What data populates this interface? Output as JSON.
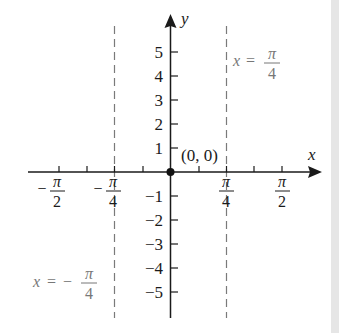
{
  "diagram": {
    "title": "",
    "axes": {
      "x_label": "x",
      "y_label": "y",
      "origin_label": "(0, 0)"
    },
    "y_ticks": [
      {
        "label": "5",
        "value": 5
      },
      {
        "label": "4",
        "value": 4
      },
      {
        "label": "3",
        "value": 3
      },
      {
        "label": "2",
        "value": 2
      },
      {
        "label": "1",
        "value": 1
      },
      {
        "label": "−1",
        "value": -1
      },
      {
        "label": "−2",
        "value": -2
      },
      {
        "label": "−3",
        "value": -3
      },
      {
        "label": "−4",
        "value": -4
      },
      {
        "label": "−5",
        "value": -5
      }
    ],
    "x_ticks": [
      {
        "sign": "−",
        "num": "π",
        "den": "2",
        "value": "-pi/2"
      },
      {
        "sign": "−",
        "num": "π",
        "den": "4",
        "value": "-pi/4"
      },
      {
        "sign": "",
        "num": "π",
        "den": "4",
        "value": "pi/4"
      },
      {
        "sign": "",
        "num": "π",
        "den": "2",
        "value": "pi/2"
      }
    ],
    "asymptotes": [
      {
        "lhs": "x",
        "eq": "=",
        "sign": "",
        "num": "π",
        "den": "4",
        "position": "right"
      },
      {
        "lhs": "x",
        "eq": "=",
        "sign": "−",
        "num": "π",
        "den": "4",
        "position": "left"
      }
    ],
    "point": {
      "label": "(0, 0)",
      "x": 0,
      "y": 0
    },
    "colors": {
      "axis": "#1a1a1a",
      "asymptote": "#7a7a7a",
      "asymptote_label": "#777777"
    }
  }
}
